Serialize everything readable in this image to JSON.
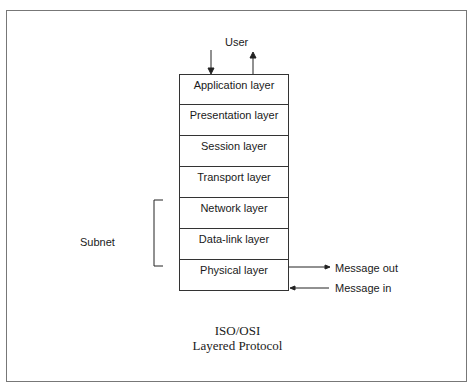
{
  "diagram": {
    "top_label": "User",
    "layers": [
      {
        "label": "Application layer"
      },
      {
        "label": "Presentation layer"
      },
      {
        "label": "Session layer"
      },
      {
        "label": "Transport layer"
      },
      {
        "label": "Network layer"
      },
      {
        "label": "Data-link layer"
      },
      {
        "label": "Physical layer"
      }
    ],
    "bracket_label": "Subnet",
    "message_out": "Message out",
    "message_in": "Message in",
    "title_line1": "ISO/OSI",
    "title_line2": "Layered Protocol"
  }
}
